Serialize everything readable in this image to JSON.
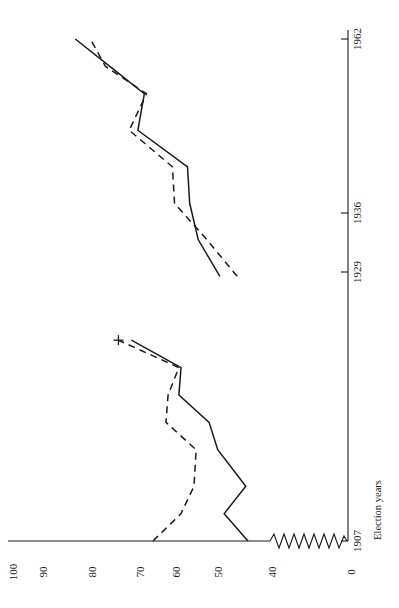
{
  "chart_data": {
    "type": "line",
    "title": "",
    "xlabel": "Election years",
    "ylabel": "",
    "orientation": "rotated-90-ccw",
    "grid": false,
    "legend": "none",
    "x": [
      1907,
      1910,
      1913,
      1917,
      1920,
      1923,
      1926,
      1929,
      1936,
      1940,
      1944,
      1948,
      1952,
      1956,
      1959,
      1962
    ],
    "xticks": [
      "1907",
      "1929",
      "1936",
      "1962"
    ],
    "xtick_values": [
      1907,
      1929,
      1936,
      1962
    ],
    "yticks": [
      "0",
      "40",
      "50",
      "60",
      "70",
      "80",
      "90",
      "100"
    ],
    "ytick_values": [
      0,
      40,
      50,
      60,
      70,
      80,
      90,
      100
    ],
    "ylim": [
      0,
      100
    ],
    "y_axis_break": {
      "present": true,
      "between": [
        0,
        40
      ],
      "style": "zigzag"
    },
    "series": [
      {
        "name": "solid-series",
        "style": "solid",
        "points": [
          {
            "year": 1907,
            "value": 46.5
          },
          {
            "year": 1910,
            "value": 52.0
          },
          {
            "year": 1913,
            "value": 47.0
          },
          {
            "year": 1917,
            "value": 53.5
          },
          {
            "year": 1920,
            "value": 55.5
          },
          {
            "year": 1923,
            "value": 62.5
          },
          {
            "year": 1926,
            "value": 62.0
          },
          {
            "year": 1929,
            "value": 73.5
          },
          {
            "year": 1936,
            "value": 53.0
          },
          {
            "year": 1940,
            "value": 58.0
          },
          {
            "year": 1944,
            "value": 60.0
          },
          {
            "year": 1948,
            "value": 60.5
          },
          {
            "year": 1952,
            "value": 72.0
          },
          {
            "year": 1956,
            "value": 70.5
          },
          {
            "year": 1959,
            "value": 78.5
          },
          {
            "year": 1962,
            "value": 86.5
          }
        ]
      },
      {
        "name": "dashed-series",
        "style": "dashed",
        "points": [
          {
            "year": 1907,
            "value": 68.5
          },
          {
            "year": 1910,
            "value": 62.0
          },
          {
            "year": 1913,
            "value": 59.0
          },
          {
            "year": 1917,
            "value": 58.5
          },
          {
            "year": 1920,
            "value": 65.5
          },
          {
            "year": 1923,
            "value": 65.0
          },
          {
            "year": 1926,
            "value": 62.5
          },
          {
            "year": 1929,
            "value": 76.5
          },
          {
            "year": 1936,
            "value": 49.0
          },
          {
            "year": 1940,
            "value": 56.0
          },
          {
            "year": 1944,
            "value": 63.5
          },
          {
            "year": 1948,
            "value": 64.0
          },
          {
            "year": 1952,
            "value": 74.0
          },
          {
            "year": 1956,
            "value": 70.0
          },
          {
            "year": 1959,
            "value": 79.5
          },
          {
            "year": 1962,
            "value": 83.0
          }
        ]
      }
    ],
    "annotations": [
      {
        "name": "cross-marker",
        "year": 1929,
        "value": 76.5,
        "symbol": "+"
      }
    ]
  },
  "axes": {
    "x_axis_title": "Election years",
    "x_tick_labels": [
      "1907",
      "1929",
      "1936",
      "1962"
    ],
    "y_tick_labels": [
      "100",
      "90",
      "80",
      "70",
      "60",
      "50",
      "40",
      "0"
    ]
  },
  "colors": {
    "ink": "#1a1a1a",
    "background": "#ffffff"
  }
}
